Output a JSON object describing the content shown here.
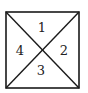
{
  "diagram": {
    "type": "square-divided-by-diagonals",
    "stroke_color": "#1a1a1a",
    "background": "#ffffff",
    "square": {
      "x": 6,
      "y": 12,
      "width": 73,
      "height": 76
    },
    "regions": [
      {
        "id": "top",
        "label": "1"
      },
      {
        "id": "right",
        "label": "2"
      },
      {
        "id": "bottom",
        "label": "3"
      },
      {
        "id": "left",
        "label": "4"
      }
    ]
  }
}
